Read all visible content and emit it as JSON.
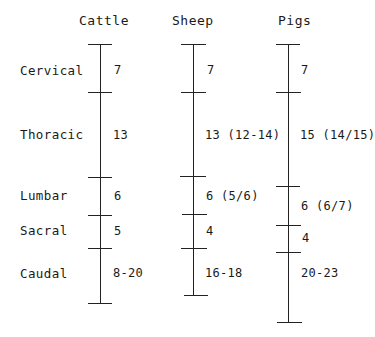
{
  "columns": [
    {
      "name": "Cattle",
      "x": 100,
      "ticks": [
        44,
        92,
        177,
        215,
        248,
        303
      ],
      "counts": [
        "7",
        "13",
        "6",
        "5",
        "8-20"
      ]
    },
    {
      "name": "Sheep",
      "x": 193,
      "ticks": [
        44,
        92,
        176,
        214,
        248,
        295
      ],
      "counts": [
        "7",
        "13 (12-14)",
        "6 (5/6)",
        "4",
        "16-18"
      ]
    },
    {
      "name": "Pigs",
      "x": 288,
      "ticks": [
        44,
        92,
        186,
        225,
        252,
        322
      ],
      "counts": [
        "7",
        "15 (14/15)",
        "6 (6/7)",
        "4",
        "20-23"
      ]
    }
  ],
  "rows": [
    {
      "label": "Cervical",
      "y": 71
    },
    {
      "label": "Thoracic",
      "y": 135
    },
    {
      "label": "Lumbar",
      "y": 196
    },
    {
      "label": "Sacral",
      "y": 231
    },
    {
      "label": "Caudal",
      "y": 274
    }
  ]
}
